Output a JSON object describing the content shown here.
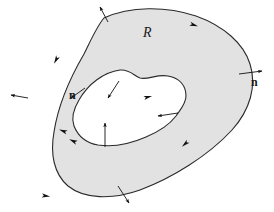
{
  "figure": {
    "width": 274,
    "height": 212,
    "background_color": "#ffffff",
    "region_fill_color": "#e2e2e2",
    "curve_stroke_color": "#2a2a2a",
    "arrow_color": "#111111",
    "label_color": "#1a1a1a"
  },
  "labels": {
    "region": "R",
    "normal_right": "n",
    "normal_inner": "n"
  },
  "geometry": {
    "outer_boundary": "M 104 18 C 130 6 166 6 196 16 C 224 26 244 44 250 64 C 257 86 250 110 232 130 C 208 156 172 178 140 190 C 112 200 84 199 68 186 C 54 174 50 154 54 132 C 58 106 70 78 84 54 C 91 40 97 26 104 18 Z",
    "inner_boundary": "M 79 100 C 88 84 104 72 120 70 C 130 69 134 76 140 78 C 148 80 157 74 168 76 C 180 78 186 86 186 96 C 186 104 180 110 176 116 C 170 124 160 131 146 137 C 130 144 112 147 98 145 C 86 143 78 136 74 126 C 71 118 73 110 79 100 Z"
  },
  "normal_arrows": [
    {
      "name": "outer-normal-top-left",
      "x1": 108,
      "y1": 22,
      "x2": 100,
      "y2": 7,
      "boundary": "outer",
      "direction": "outward"
    },
    {
      "name": "outer-normal-left",
      "x1": 28,
      "y1": 98,
      "x2": 11,
      "y2": 95,
      "boundary": "outer",
      "direction": "outward"
    },
    {
      "name": "outer-normal-right",
      "x1": 239,
      "y1": 74,
      "x2": 262,
      "y2": 71,
      "boundary": "outer",
      "direction": "outward"
    },
    {
      "name": "outer-normal-bottom",
      "x1": 118,
      "y1": 186,
      "x2": 129,
      "y2": 203,
      "boundary": "outer",
      "direction": "outward"
    },
    {
      "name": "inner-normal-upper-left",
      "x1": 85,
      "y1": 88,
      "x2": 71,
      "y2": 98,
      "boundary": "inner",
      "direction": "into-hole"
    },
    {
      "name": "inner-normal-upper-mid",
      "x1": 119,
      "y1": 81,
      "x2": 108,
      "y2": 98,
      "boundary": "inner",
      "direction": "into-hole"
    },
    {
      "name": "inner-normal-right",
      "x1": 178,
      "y1": 113,
      "x2": 158,
      "y2": 116,
      "boundary": "inner",
      "direction": "into-hole"
    },
    {
      "name": "inner-normal-bottom",
      "x1": 105,
      "y1": 147,
      "x2": 105,
      "y2": 123,
      "boundary": "inner",
      "direction": "into-hole"
    }
  ],
  "orientation_markers": [
    {
      "name": "outer-orientation-top-right",
      "x": 194,
      "y": 25,
      "angle": 18,
      "boundary": "outer"
    },
    {
      "name": "outer-orientation-upper-left",
      "x": 56,
      "y": 60,
      "angle": 118,
      "boundary": "outer"
    },
    {
      "name": "outer-orientation-lower-right",
      "x": 185,
      "y": 144,
      "angle": 138,
      "boundary": "outer"
    },
    {
      "name": "outer-orientation-bottom",
      "x": 46,
      "y": 196,
      "angle": 8,
      "boundary": "outer"
    },
    {
      "name": "inner-orientation-left",
      "x": 63,
      "y": 131,
      "angle": 200,
      "boundary": "inner"
    },
    {
      "name": "inner-orientation-bottom",
      "x": 73,
      "y": 141,
      "angle": 205,
      "boundary": "inner"
    },
    {
      "name": "inner-orientation-top",
      "x": 148,
      "y": 97,
      "angle": 346,
      "boundary": "inner"
    }
  ]
}
